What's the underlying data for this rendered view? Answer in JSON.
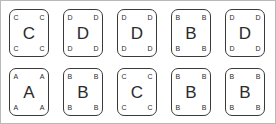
{
  "canvas": {
    "width": 276,
    "height": 124,
    "background_color": "#ffffff",
    "border_color": "#b9b9b9"
  },
  "card_style": {
    "border_color": "#3a3a3a",
    "text_color": "#2b2b2b",
    "fill_color": "#ffffff"
  },
  "grid": {
    "rows": 2,
    "columns": 5,
    "total_cards": 10
  },
  "cards": [
    {
      "letter": "C",
      "corner_letter": "C",
      "row": 1,
      "column": 1
    },
    {
      "letter": "D",
      "corner_letter": "D",
      "row": 1,
      "column": 2
    },
    {
      "letter": "D",
      "corner_letter": "D",
      "row": 1,
      "column": 3
    },
    {
      "letter": "B",
      "corner_letter": "B",
      "row": 1,
      "column": 4
    },
    {
      "letter": "D",
      "corner_letter": "D",
      "row": 1,
      "column": 5
    },
    {
      "letter": "A",
      "corner_letter": "A",
      "row": 2,
      "column": 1
    },
    {
      "letter": "B",
      "corner_letter": "B",
      "row": 2,
      "column": 2
    },
    {
      "letter": "C",
      "corner_letter": "C",
      "row": 2,
      "column": 3
    },
    {
      "letter": "B",
      "corner_letter": "B",
      "row": 2,
      "column": 4
    },
    {
      "letter": "B",
      "corner_letter": "B",
      "row": 2,
      "column": 5
    }
  ]
}
